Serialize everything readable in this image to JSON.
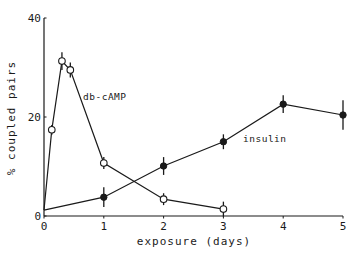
{
  "chart_data": {
    "type": "line",
    "title": "",
    "xlabel": "exposure (days)",
    "ylabel": "% coupled pairs",
    "xlim": [
      0,
      5
    ],
    "ylim": [
      0,
      40
    ],
    "x_ticks": [
      0,
      1,
      2,
      3,
      4,
      5
    ],
    "x_tick_labels": [
      "0",
      "1",
      "2",
      "3",
      "4",
      "5"
    ],
    "y_ticks": [
      0,
      20,
      40
    ],
    "y_tick_labels": [
      "0",
      "20",
      "40"
    ],
    "grid": false,
    "legend": "none (series labeled inline)",
    "series": [
      {
        "name": "db-cAMP",
        "marker": "open-circle",
        "x": [
          0,
          0.13,
          0.3,
          0.44,
          1,
          2,
          3
        ],
        "y": [
          1.2,
          17.4,
          31.3,
          29.5,
          10.7,
          3.4,
          1.4
        ],
        "error": [
          0,
          1.0,
          1.8,
          1.5,
          1.2,
          1.2,
          1.5
        ]
      },
      {
        "name": "insulin",
        "marker": "filled-circle",
        "x": [
          0,
          1,
          2,
          3,
          4,
          5
        ],
        "y": [
          1.2,
          3.8,
          10.1,
          15.0,
          22.6,
          20.4
        ],
        "error": [
          0,
          2.0,
          1.8,
          1.5,
          1.8,
          3.0
        ]
      }
    ],
    "annotations": [
      {
        "text": "db-cAMP",
        "near": "db-cAMP series, right of peak"
      },
      {
        "text": "insulin",
        "near": "insulin series, between days 2 and 4"
      }
    ]
  },
  "labels": {
    "xlabel": "exposure (days)",
    "ylabel": "% coupled pairs",
    "annot_camp": "db-cAMP",
    "annot_insulin": "insulin"
  }
}
